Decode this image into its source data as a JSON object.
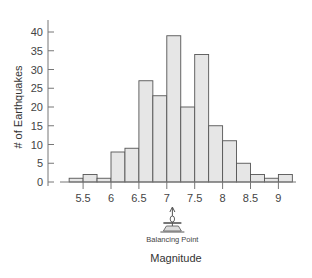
{
  "chart_data": {
    "type": "bar",
    "subtype": "histogram",
    "title": "",
    "xlabel": "Magnitude",
    "ylabel": "# of Earthquakes",
    "bin_width": 0.25,
    "bins": [
      {
        "start": 5.25,
        "end": 5.5,
        "count": 1
      },
      {
        "start": 5.5,
        "end": 5.75,
        "count": 2
      },
      {
        "start": 5.75,
        "end": 6.0,
        "count": 1
      },
      {
        "start": 6.0,
        "end": 6.25,
        "count": 8
      },
      {
        "start": 6.25,
        "end": 6.5,
        "count": 9
      },
      {
        "start": 6.5,
        "end": 6.75,
        "count": 27
      },
      {
        "start": 6.75,
        "end": 7.0,
        "count": 23
      },
      {
        "start": 7.0,
        "end": 7.25,
        "count": 39
      },
      {
        "start": 7.25,
        "end": 7.5,
        "count": 20
      },
      {
        "start": 7.5,
        "end": 7.75,
        "count": 34
      },
      {
        "start": 7.75,
        "end": 8.0,
        "count": 15
      },
      {
        "start": 8.0,
        "end": 8.25,
        "count": 11
      },
      {
        "start": 8.25,
        "end": 8.5,
        "count": 5
      },
      {
        "start": 8.5,
        "end": 8.75,
        "count": 2
      },
      {
        "start": 8.75,
        "end": 9.0,
        "count": 1
      },
      {
        "start": 9.0,
        "end": 9.25,
        "count": 2
      }
    ],
    "x_ticks": [
      "5.5",
      "6",
      "6.5",
      "7",
      "7.5",
      "8",
      "8.5",
      "9"
    ],
    "x_tick_values": [
      5.5,
      6,
      6.5,
      7,
      7.5,
      8,
      8.5,
      9
    ],
    "y_ticks": [
      "0",
      "5",
      "10",
      "15",
      "20",
      "25",
      "30",
      "35",
      "40"
    ],
    "y_tick_values": [
      0,
      5,
      10,
      15,
      20,
      25,
      30,
      35,
      40
    ],
    "ylim": [
      0,
      40
    ],
    "xlim": [
      5.25,
      9.25
    ],
    "grid": false,
    "legend": null,
    "annotation": {
      "label": "Balancing Point",
      "x": 7.1
    },
    "colors": {
      "bar_fill": "#e6e6e6",
      "bar_stroke": "#555555",
      "axis": "#777777"
    }
  }
}
